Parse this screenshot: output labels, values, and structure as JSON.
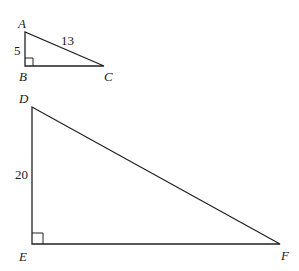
{
  "diagram": {
    "triangle_abc": {
      "vertices": {
        "A": "A",
        "B": "B",
        "C": "C"
      },
      "side_ab": "5",
      "side_ac": "13",
      "right_angle_at": "B"
    },
    "triangle_def": {
      "vertices": {
        "D": "D",
        "E": "E",
        "F": "F"
      },
      "side_de": "20",
      "right_angle_at": "E"
    }
  }
}
